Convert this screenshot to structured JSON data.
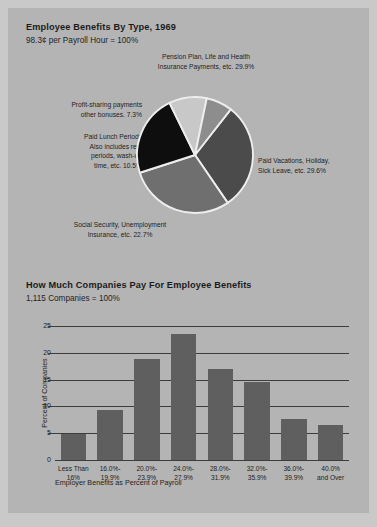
{
  "page": {
    "background_color": "#b4b4b4",
    "margin_color": "#c9c9c9"
  },
  "pie_section": {
    "title": "Employee Benefits By Type, 1969",
    "subtitle": "98.3¢ per Payroll Hour = 100%",
    "labels": {
      "pension": "Pension Plan, Life and Health\nInsurance Payments, etc. 29.9%",
      "profit_sharing": "Profit-sharing payments\nother bonuses. 7.3%",
      "paid_lunch": "Paid Lunch Periods\nAlso includes rest\nperiods, wash-up\ntime, etc. 10.5%",
      "social_security": "Social Security, Unemployment\nInsurance, etc. 22.7%",
      "paid_vacations": "Paid Vacations, Holiday,\nSick Leave, etc. 29.6%"
    }
  },
  "bar_section": {
    "title": "How Much Companies Pay For Employee Benefits",
    "subtitle": "1,115 Companies = 100%"
  },
  "chart_data": [
    {
      "type": "pie",
      "title": "Employee Benefits By Type, 1969",
      "subtitle": "98.3¢ per Payroll Hour = 100%",
      "unit": "percent",
      "total_label": "98.3¢ per Payroll Hour = 100%",
      "legend_position": "callout-labels",
      "start_angle_deg": -52,
      "slices": [
        {
          "name": "Pension Plan, Life and Health Insurance Payments, etc.",
          "label": "Pension Plan, Life and Health\nInsurance Payments, etc. 29.9%",
          "value": 29.9,
          "color": "#4b4b4b"
        },
        {
          "name": "Paid Vacations, Holiday, Sick Leave, etc.",
          "label": "Paid Vacations, Holiday,\nSick Leave, etc. 29.6%",
          "value": 29.6,
          "color": "#6f6f6f"
        },
        {
          "name": "Social Security, Unemployment Insurance, etc.",
          "label": "Social Security, Unemployment\nInsurance, etc. 22.7%",
          "value": 22.7,
          "color": "#0e0e0e"
        },
        {
          "name": "Paid Lunch Periods Also includes rest periods, wash-up time, etc.",
          "label": "Paid Lunch Periods\nAlso includes rest\nperiods, wash-up\ntime, etc. 10.5%",
          "value": 10.5,
          "color": "#c8c8c8"
        },
        {
          "name": "Profit-sharing payments other bonuses",
          "label": "Profit-sharing payments\nother bonuses. 7.3%",
          "value": 7.3,
          "color": "#8d8d8d"
        }
      ]
    },
    {
      "type": "bar",
      "title": "How Much Companies Pay For Employee Benefits",
      "subtitle": "1,115 Companies = 100%",
      "xlabel": "Employer Benefits as Percent of Payroll",
      "ylabel": "Percent of Companies",
      "ylim": [
        0,
        25
      ],
      "yticks": [
        5,
        10,
        15,
        20,
        25
      ],
      "grid": true,
      "bar_color": "#5f5f5f",
      "categories": [
        "Less Than\n16%",
        "16.0%-\n19.9%",
        "20.0%-\n23.9%",
        "24.0%-\n27.9%",
        "28.0%-\n31.9%",
        "32.0%-\n35.9%",
        "36.0%-\n39.9%",
        "40.0%\nand Over"
      ],
      "values": [
        4.8,
        9.4,
        18.8,
        23.5,
        17.0,
        14.6,
        7.7,
        6.6
      ]
    }
  ]
}
